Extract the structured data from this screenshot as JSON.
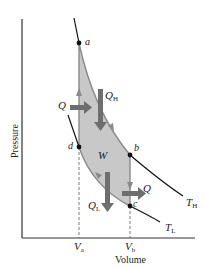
{
  "diagram": {
    "type": "Carnot cycle PV diagram",
    "axes": {
      "xlabel": "Volume",
      "ylabel": "Pressure",
      "x_ticks": [
        {
          "main": "V",
          "sub": "a"
        },
        {
          "main": "V",
          "sub": "b"
        }
      ]
    },
    "points": {
      "a": "a",
      "b": "b",
      "c": "c",
      "d": "d"
    },
    "isotherms": {
      "high": {
        "main": "T",
        "sub": "H"
      },
      "low": {
        "main": "T",
        "sub": "L"
      }
    },
    "labels": {
      "work": "W",
      "q_left": "Q",
      "q_right": "Q",
      "q_high": {
        "main": "Q",
        "sub": "H"
      },
      "q_low": {
        "main": "Q",
        "sub": "L"
      }
    },
    "colors": {
      "cycle_fill": "#c8c8c8",
      "cycle_edge": "#8a8a8a",
      "arrow": "#6e6e6e",
      "curve": "#111111",
      "axis": "#333333"
    }
  }
}
